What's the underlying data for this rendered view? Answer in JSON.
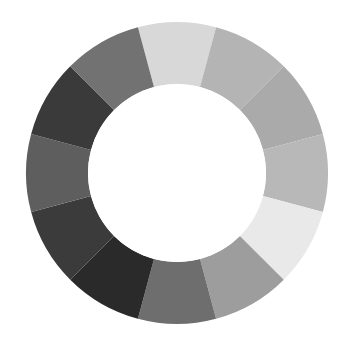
{
  "chart_data": {
    "type": "pie",
    "title": "",
    "subtitle": "",
    "xlabel": "",
    "ylabel": "",
    "variant": "donut",
    "grid": false,
    "legend_position": "none",
    "background_color": "#ffffff",
    "center_x": 177,
    "center_y": 173,
    "outer_radius": 151,
    "inner_radius": 89,
    "hole_color": "#ffffff",
    "start_angle_deg": -105,
    "direction": "clockwise",
    "segment_count": 12,
    "categories": [
      "seg-01",
      "seg-02",
      "seg-03",
      "seg-04",
      "seg-05",
      "seg-06",
      "seg-07",
      "seg-08",
      "seg-09",
      "seg-10",
      "seg-11",
      "seg-12"
    ],
    "values": [
      30,
      30,
      30,
      30,
      30,
      30,
      30,
      30,
      30,
      30,
      30,
      30
    ],
    "values_unit": "degrees",
    "colors": [
      "#d8d8d8",
      "#b4b4b4",
      "#aaaaaa",
      "#b8b8b8",
      "#e9e9e9",
      "#9d9d9d",
      "#6e6e6e",
      "#2a2a2a",
      "#3b3b3b",
      "#5e5e5e",
      "#3a3a3a",
      "#727272"
    ],
    "segments": [
      {
        "label": "seg-01",
        "start_deg": -105,
        "end_deg": -75,
        "sweep_deg": 30,
        "color": "#d8d8d8",
        "tone": "light"
      },
      {
        "label": "seg-02",
        "start_deg": -75,
        "end_deg": -45,
        "sweep_deg": 30,
        "color": "#b4b4b4",
        "tone": "medium-light"
      },
      {
        "label": "seg-03",
        "start_deg": -45,
        "end_deg": -15,
        "sweep_deg": 30,
        "color": "#aaaaaa",
        "tone": "medium-light"
      },
      {
        "label": "seg-04",
        "start_deg": -15,
        "end_deg": 15,
        "sweep_deg": 30,
        "color": "#b8b8b8",
        "tone": "medium-light"
      },
      {
        "label": "seg-05",
        "start_deg": 15,
        "end_deg": 45,
        "sweep_deg": 30,
        "color": "#e9e9e9",
        "tone": "lightest"
      },
      {
        "label": "seg-06",
        "start_deg": 45,
        "end_deg": 75,
        "sweep_deg": 30,
        "color": "#9d9d9d",
        "tone": "medium"
      },
      {
        "label": "seg-07",
        "start_deg": 75,
        "end_deg": 105,
        "sweep_deg": 30,
        "color": "#6e6e6e",
        "tone": "medium-dark"
      },
      {
        "label": "seg-08",
        "start_deg": 105,
        "end_deg": 135,
        "sweep_deg": 30,
        "color": "#2a2a2a",
        "tone": "darkest"
      },
      {
        "label": "seg-09",
        "start_deg": 135,
        "end_deg": 165,
        "sweep_deg": 30,
        "color": "#3b3b3b",
        "tone": "dark"
      },
      {
        "label": "seg-10",
        "start_deg": 165,
        "end_deg": 195,
        "sweep_deg": 30,
        "color": "#5e5e5e",
        "tone": "medium-dark"
      },
      {
        "label": "seg-11",
        "start_deg": 195,
        "end_deg": 225,
        "sweep_deg": 30,
        "color": "#3a3a3a",
        "tone": "dark"
      },
      {
        "label": "seg-12",
        "start_deg": 225,
        "end_deg": 255,
        "sweep_deg": 30,
        "color": "#727272",
        "tone": "medium-dark"
      }
    ]
  }
}
